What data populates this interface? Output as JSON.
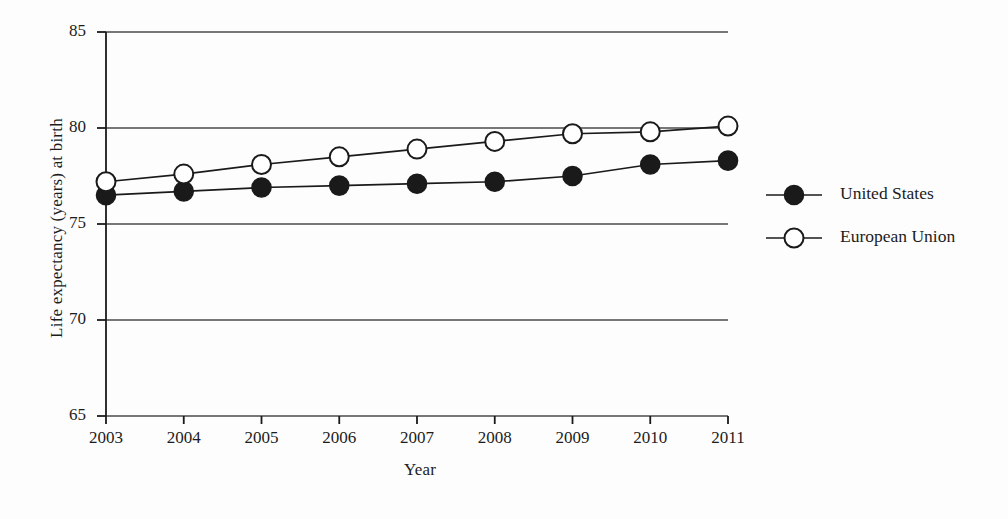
{
  "chart_data": {
    "type": "line",
    "title": "",
    "xlabel": "Year",
    "ylabel": "Life expectancy (years) at birth",
    "x": [
      2003,
      2004,
      2005,
      2006,
      2007,
      2008,
      2009,
      2010,
      2011
    ],
    "xticklabels": [
      "2003",
      "2004",
      "2005",
      "2006",
      "2007",
      "2008",
      "2009",
      "2010",
      "2011"
    ],
    "yticklabels": [
      "65",
      "70",
      "75",
      "80",
      "85"
    ],
    "yticks": [
      65,
      70,
      75,
      80,
      85
    ],
    "ylim": [
      65,
      85
    ],
    "xlim": [
      2003,
      2011
    ],
    "grid": "horizontal",
    "legend_position": "right",
    "series": [
      {
        "name": "United States",
        "marker": "filled-circle",
        "marker_fill": "#1a1a1a",
        "line_color": "#1a1a1a",
        "values": [
          76.5,
          76.7,
          76.9,
          77.0,
          77.1,
          77.2,
          77.5,
          78.1,
          78.3
        ]
      },
      {
        "name": "European Union",
        "marker": "open-circle",
        "marker_fill": "#ffffff",
        "line_color": "#1a1a1a",
        "values": [
          77.2,
          77.6,
          78.1,
          78.5,
          78.9,
          79.3,
          79.7,
          79.8,
          80.1
        ]
      }
    ]
  },
  "axes": {
    "y_title": "Life expectancy (years) at birth",
    "x_title": "Year",
    "y_ticks": [
      {
        "label": "85"
      },
      {
        "label": "80"
      },
      {
        "label": "75"
      },
      {
        "label": "70"
      },
      {
        "label": "65"
      }
    ],
    "x_ticks": [
      {
        "label": "2003"
      },
      {
        "label": "2004"
      },
      {
        "label": "2005"
      },
      {
        "label": "2006"
      },
      {
        "label": "2007"
      },
      {
        "label": "2008"
      },
      {
        "label": "2009"
      },
      {
        "label": "2010"
      },
      {
        "label": "2011"
      }
    ]
  },
  "legend": {
    "entries": [
      {
        "label": "United States",
        "marker": "filled-circle"
      },
      {
        "label": "European Union",
        "marker": "open-circle"
      }
    ]
  },
  "colors": {
    "ink": "#1a1a1a",
    "grid": "#4a4a4a",
    "background": "#fdfdfd"
  }
}
